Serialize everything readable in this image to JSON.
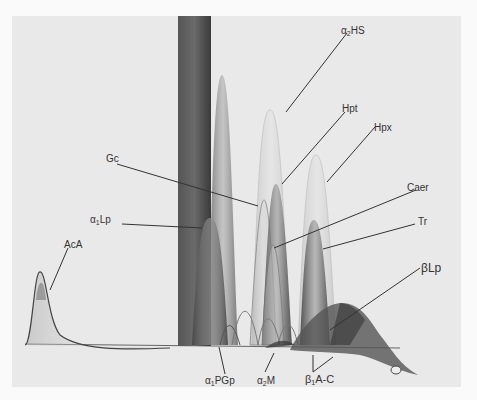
{
  "figure": {
    "labels": {
      "a2hs": {
        "prefix": "α",
        "sub": "2",
        "name": "HS"
      },
      "hpt": {
        "name": "Hpt"
      },
      "hpx": {
        "name": "Hpx"
      },
      "gc": {
        "name": "Gc"
      },
      "caer": {
        "name": "Caer"
      },
      "tr": {
        "name": "Tr"
      },
      "a1lp": {
        "prefix": "α",
        "sub": "1",
        "name": "Lp"
      },
      "aca": {
        "name": "AcA"
      },
      "blp": {
        "prefix": "β",
        "sub": "",
        "name": "Lp"
      },
      "a1pgp": {
        "prefix": "α",
        "sub": "1",
        "name": "PGp"
      },
      "a2m": {
        "prefix": "α",
        "sub": "2",
        "name": "M"
      },
      "bac": {
        "prefix": "β",
        "sub": "1",
        "name": "A-C"
      }
    },
    "colors": {
      "background": "#e9e9e9",
      "page": "#fafafa",
      "ink": "#333333"
    }
  }
}
